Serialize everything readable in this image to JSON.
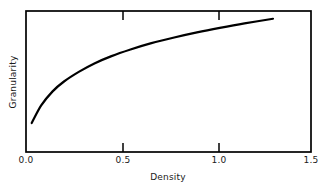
{
  "chart_data": {
    "type": "line",
    "title": "",
    "xlabel": "Density",
    "ylabel": "Granularity",
    "xlim": [
      0.0,
      1.5
    ],
    "ylim": [
      0,
      1
    ],
    "grid": false,
    "legend": null,
    "xticks": [
      "0.0",
      "0.5",
      "1.0",
      "1.5"
    ],
    "xtick_values": [
      0.0,
      0.5,
      1.0,
      1.5
    ],
    "yticks": [],
    "ytick_values": [],
    "axis_style": "box-frame-with-inward-ticks",
    "tick_locations": "top-and-bottom",
    "line_color": "#000000",
    "line_width_px": 2.2,
    "series": [
      {
        "name": "Granularity vs Density",
        "x": [
          0.03,
          0.08,
          0.14,
          0.2,
          0.28,
          0.36,
          0.45,
          0.55,
          0.66,
          0.78,
          0.9,
          1.02,
          1.15,
          1.3
        ],
        "y": [
          0.205,
          0.33,
          0.43,
          0.5,
          0.57,
          0.628,
          0.68,
          0.727,
          0.772,
          0.812,
          0.848,
          0.88,
          0.912,
          0.945
        ]
      }
    ]
  },
  "geometry": {
    "plot_left_px": 26,
    "plot_right_px": 311,
    "plot_top_px": 11,
    "plot_bottom_px": 152
  },
  "colors": {
    "background": "#ffffff",
    "axis": "#000000",
    "text": "#1a1a1a",
    "curve": "#000000"
  }
}
